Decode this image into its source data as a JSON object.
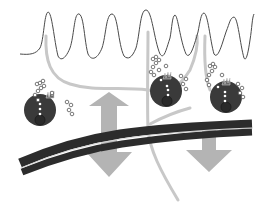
{
  "diagram": {
    "colors": {
      "background": "#ffffff",
      "waveform": "#4a4a4a",
      "nerve_fiber": "#c8c8c8",
      "cell_body": "#3a3a3a",
      "nucleus": "#2a2a2a",
      "granule": "#ffffff",
      "vessel": "#2c2c2c",
      "vessel_lumen": "#d8d8d8",
      "arrow": "#b4b4b4"
    },
    "elements": [
      {
        "id": "waveform",
        "type": "oscillating-signal-trace"
      },
      {
        "id": "nerve-fiber-1",
        "type": "branching-fiber"
      },
      {
        "id": "nerve-fiber-2",
        "type": "branching-fiber"
      },
      {
        "id": "nerve-fiber-3",
        "type": "fiber"
      },
      {
        "id": "cell-1",
        "type": "degranulating-cell"
      },
      {
        "id": "cell-2",
        "type": "degranulating-cell"
      },
      {
        "id": "cell-3",
        "type": "degranulating-cell"
      },
      {
        "id": "vessel",
        "type": "double-line-vessel"
      },
      {
        "id": "arrow-bidirectional",
        "type": "double-headed-vertical-arrow"
      },
      {
        "id": "arrow-down",
        "type": "downward-arrow"
      }
    ]
  }
}
